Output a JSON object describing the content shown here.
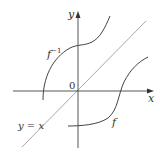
{
  "diagram": {
    "axes": {
      "x_label": "x",
      "y_label": "y",
      "origin_label": "0"
    },
    "curves": [
      {
        "id": "f",
        "label": "f",
        "color": "#333333"
      },
      {
        "id": "f_inverse",
        "label": "f",
        "superscript": "−1",
        "color": "#333333"
      },
      {
        "id": "identity",
        "label": "y = x",
        "color": "#aaaaaa"
      }
    ],
    "colors": {
      "axis": "#333333",
      "curve": "#333333",
      "identity_line": "#aaaaaa",
      "text": "#333333",
      "background": "#ffffff"
    }
  }
}
